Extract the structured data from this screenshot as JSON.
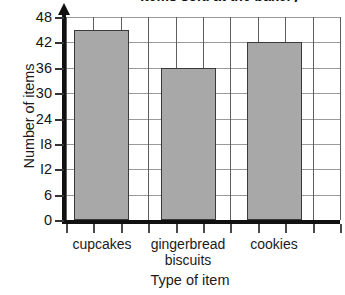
{
  "figure": {
    "title_fragment": "Items sold at the bakery",
    "title_visible": false
  },
  "chart_data": {
    "type": "bar",
    "title": "",
    "xlabel": "Type of item",
    "ylabel": "Number of items",
    "categories": [
      "cupcakes",
      "gingerbread biscuits",
      "cookies"
    ],
    "values": [
      45,
      36,
      42
    ],
    "series": [
      {
        "name": "Number of items",
        "values": [
          45,
          36,
          42
        ]
      }
    ],
    "ylim": [
      0,
      48
    ],
    "ytick_values": [
      0,
      6,
      12,
      18,
      24,
      30,
      36,
      42,
      48
    ],
    "ytick_labels": [
      "0",
      "6",
      "I2",
      "I8",
      "24",
      "30",
      "36",
      "42",
      "48"
    ],
    "grid": true,
    "grid_axis": "both",
    "legend": false,
    "legend_position": "none",
    "bar_color": "#a8a8a8",
    "bar_edge_color": "#3a3a3a",
    "axis_color": "#111111",
    "gridline_color": "#5e5e5e"
  },
  "axes": {
    "y": {
      "title": "Number of items",
      "ticks": [
        {
          "value": 0,
          "label": "0"
        },
        {
          "value": 6,
          "label": "6"
        },
        {
          "value": 12,
          "label": "I2"
        },
        {
          "value": 18,
          "label": "I8"
        },
        {
          "value": 24,
          "label": "24"
        },
        {
          "value": 30,
          "label": "30"
        },
        {
          "value": 36,
          "label": "36"
        },
        {
          "value": 42,
          "label": "42"
        },
        {
          "value": 48,
          "label": "48"
        }
      ]
    },
    "x": {
      "title": "Type of item",
      "categories": [
        {
          "label_line1": "cupcakes",
          "label_line2": ""
        },
        {
          "label_line1": "gingerbread",
          "label_line2": "biscuits"
        },
        {
          "label_line1": "cookies",
          "label_line2": ""
        }
      ]
    }
  },
  "bars": [
    {
      "category": "cupcakes",
      "value": 45
    },
    {
      "category": "gingerbread biscuits",
      "value": 36
    },
    {
      "category": "cookies",
      "value": 42
    }
  ]
}
